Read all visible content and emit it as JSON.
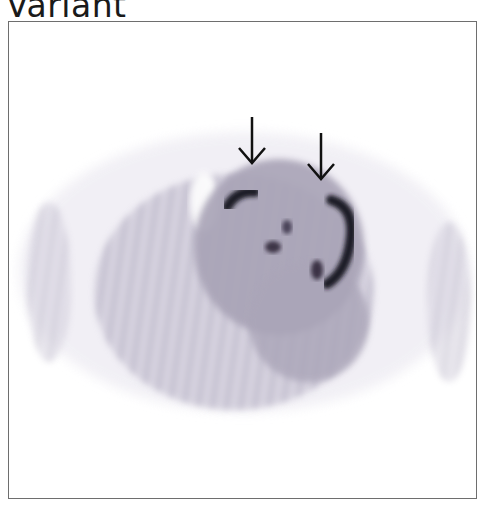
{
  "figure": {
    "label": "Variant",
    "image_description": "Axial nuclear medicine (PET/SPECT) slice, grayscale, with two arrows pointing to foci of increased uptake",
    "annotations": [
      {
        "type": "arrow",
        "direction": "down",
        "x": 251,
        "y1": 116,
        "y2": 160
      },
      {
        "type": "arrow",
        "direction": "down",
        "x": 320,
        "y1": 132,
        "y2": 177
      }
    ],
    "colors": {
      "frame": "#6e6e6e",
      "uptake_dark": "#1e1a26",
      "background_activity": "#bdb9c8"
    }
  }
}
